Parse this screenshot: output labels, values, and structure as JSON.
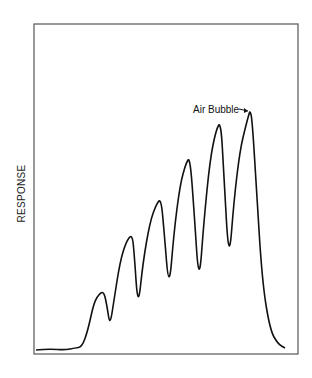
{
  "chart_data": {
    "type": "line",
    "title": "",
    "xlabel": "",
    "ylabel": "RESPONSE",
    "grid": false,
    "legend": null,
    "annotations": [
      {
        "text": "Air Bubble",
        "arrow_to": "final peak spike"
      }
    ],
    "series": [
      {
        "name": "response",
        "points_px": [
          [
            36,
            350
          ],
          [
            50,
            349
          ],
          [
            65,
            350
          ],
          [
            75,
            348
          ],
          [
            82,
            347
          ],
          [
            88,
            330
          ],
          [
            94,
            302
          ],
          [
            100,
            293
          ],
          [
            104,
            292
          ],
          [
            107,
            306
          ],
          [
            110,
            326
          ],
          [
            114,
            300
          ],
          [
            120,
            262
          ],
          [
            126,
            242
          ],
          [
            132,
            234
          ],
          [
            134,
            250
          ],
          [
            138,
            310
          ],
          [
            143,
            262
          ],
          [
            150,
            222
          ],
          [
            156,
            205
          ],
          [
            161,
            198
          ],
          [
            164,
            230
          ],
          [
            169,
            292
          ],
          [
            174,
            232
          ],
          [
            180,
            185
          ],
          [
            186,
            163
          ],
          [
            190,
            157
          ],
          [
            194,
            210
          ],
          [
            199,
            287
          ],
          [
            204,
            220
          ],
          [
            210,
            160
          ],
          [
            216,
            130
          ],
          [
            221,
            121
          ],
          [
            224,
            180
          ],
          [
            229,
            264
          ],
          [
            234,
            200
          ],
          [
            240,
            150
          ],
          [
            246,
            125
          ],
          [
            249,
            114
          ],
          [
            250,
            111
          ],
          [
            252,
            118
          ],
          [
            256,
            180
          ],
          [
            262,
            280
          ],
          [
            270,
            330
          ],
          [
            278,
            344
          ],
          [
            285,
            348
          ]
        ]
      }
    ],
    "frame": {
      "x0": 34,
      "y0": 24,
      "x1": 298,
      "y1": 354
    }
  },
  "labels": {
    "ylabel": "RESPONSE",
    "annotation": "Air Bubble"
  }
}
